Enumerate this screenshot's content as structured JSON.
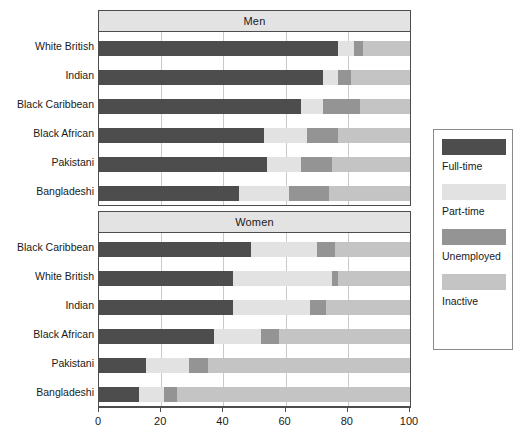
{
  "chart_data": {
    "type": "bar",
    "orientation": "horizontal",
    "stacked": true,
    "stack_mode": "percent",
    "title": "",
    "xlabel": "",
    "ylabel": "",
    "xlim": [
      0,
      100
    ],
    "xticks": [
      0,
      20,
      40,
      60,
      80,
      100
    ],
    "xtick_labels": [
      "0",
      "20",
      "40",
      "60",
      "80",
      "100"
    ],
    "grid": true,
    "grid_axis": "x",
    "legend_position": "right",
    "series": [
      {
        "name": "Full-time",
        "color": "#4d4d4d"
      },
      {
        "name": "Part-time",
        "color": "#e2e2e2"
      },
      {
        "name": "Unemployed",
        "color": "#949494"
      },
      {
        "name": "Inactive",
        "color": "#c4c4c4"
      }
    ],
    "panels": [
      {
        "label": "Men",
        "categories": [
          "White British",
          "Indian",
          "Black Caribbean",
          "Black African",
          "Pakistani",
          "Bangladeshi"
        ],
        "values": {
          "Full-time": [
            77,
            72,
            65,
            53,
            54,
            45
          ],
          "Part-time": [
            5,
            5,
            7,
            14,
            11,
            16
          ],
          "Unemployed": [
            3,
            4,
            12,
            10,
            10,
            13
          ],
          "Inactive": [
            15,
            19,
            16,
            23,
            25,
            26
          ]
        }
      },
      {
        "label": "Women",
        "categories": [
          "Black Caribbean",
          "White British",
          "Indian",
          "Black African",
          "Pakistani",
          "Bangladeshi"
        ],
        "values": {
          "Full-time": [
            49,
            43,
            43,
            37,
            15,
            13
          ],
          "Part-time": [
            21,
            32,
            25,
            15,
            14,
            8
          ],
          "Unemployed": [
            6,
            2,
            5,
            6,
            6,
            4
          ],
          "Inactive": [
            24,
            23,
            27,
            42,
            65,
            75
          ]
        }
      }
    ]
  },
  "legend": {
    "entries": [
      {
        "label": "Full-time",
        "color": "#4d4d4d"
      },
      {
        "label": "Part-time",
        "color": "#e2e2e2"
      },
      {
        "label": "Unemployed",
        "color": "#949494"
      },
      {
        "label": "Inactive",
        "color": "#c4c4c4"
      }
    ]
  },
  "colors": {
    "full_time": "#4d4d4d",
    "part_time": "#e2e2e2",
    "unemployed": "#949494",
    "inactive": "#c4c4c4",
    "strip_bg": "#e3e3e3",
    "frame": "#4d4d4d",
    "gridline": "#c9c9c9",
    "background": "#ffffff"
  }
}
